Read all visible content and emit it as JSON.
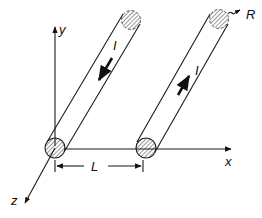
{
  "figure": {
    "type": "two parallel conducting rods in 3D coordinate frame",
    "axes": {
      "x_label": "x",
      "y_label": "y",
      "z_label": "z"
    },
    "conductors": [
      {
        "name": "left-rod",
        "current_label": "I",
        "current_direction": "toward viewer (down-left)"
      },
      {
        "name": "right-rod",
        "current_label": "I",
        "current_direction": "away from viewer (up-right)"
      }
    ],
    "separation_label": "L",
    "radius_label": "R"
  }
}
